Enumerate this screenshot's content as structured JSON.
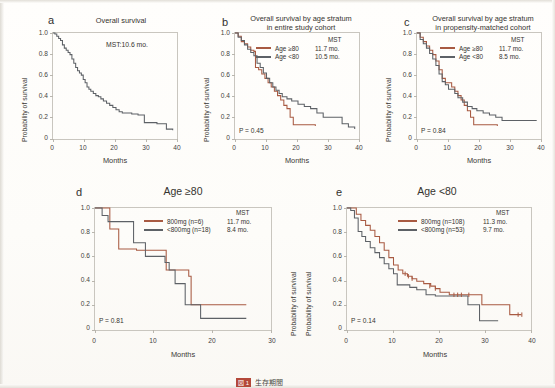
{
  "figure": {
    "caption_tag": "図 1",
    "caption_text": "生存期間",
    "colors": {
      "series_a": "#a85a42",
      "series_b": "#5d6166",
      "axis": "#c9c6bf",
      "text": "#35332f"
    }
  },
  "common": {
    "ylabel": "Probability of survival",
    "xlabel": "Months",
    "yticks": [
      "1.0",
      "0.8",
      "0.6",
      "0.4",
      "0.2",
      "0"
    ],
    "xticks_40": [
      "0",
      "10",
      "20",
      "30",
      "40"
    ],
    "xticks_30": [
      "0",
      "10",
      "20",
      "30"
    ],
    "mst_header": "MST"
  },
  "panels": [
    {
      "id": "a",
      "label": "a",
      "title": "Overall survival",
      "annotation": "MST:10.6 mo.",
      "xticks": [
        "0",
        "10",
        "20",
        "30",
        "40"
      ],
      "xmax": 40
    },
    {
      "id": "b",
      "label": "b",
      "title_line1": "Overall survival by age stratum",
      "title_line2": "in entire study cohort",
      "pvalue": "P = 0.45",
      "xticks": [
        "0",
        "10",
        "20",
        "30",
        "40"
      ],
      "xmax": 40,
      "legend": [
        {
          "name": "Age ≥80",
          "mst": "11.7 mo.",
          "color": "#a85a42"
        },
        {
          "name": "Age <80",
          "mst": "10.5 mo.",
          "color": "#5d6166"
        }
      ]
    },
    {
      "id": "c",
      "label": "c",
      "title_line1": "Overall survival by age stratum",
      "title_line2": "in propensity-matched cohort",
      "pvalue": "P = 0.84",
      "xticks": [
        "0",
        "10",
        "20",
        "30",
        "40"
      ],
      "xmax": 40,
      "legend": [
        {
          "name": "Age ≥80",
          "mst": "11.7 mo.",
          "color": "#a85a42"
        },
        {
          "name": "Age <80",
          "mst": "8.5 mo.",
          "color": "#5d6166"
        }
      ]
    },
    {
      "id": "d",
      "label": "d",
      "title": "Age ≥80",
      "pvalue": "P = 0.81",
      "xticks": [
        "0",
        "10",
        "20",
        "30"
      ],
      "xmax": 30,
      "legend": [
        {
          "name": "800mg (n=6)",
          "mst": "11.7 mo.",
          "color": "#a85a42"
        },
        {
          "name": "<800mg (n=18)",
          "mst": "8.4 mo.",
          "color": "#5d6166"
        }
      ]
    },
    {
      "id": "e",
      "label": "e",
      "title": "Age <80",
      "pvalue": "P = 0.14",
      "xticks": [
        "0",
        "10",
        "20",
        "30",
        "40"
      ],
      "xmax": 40,
      "legend": [
        {
          "name": "800mg (n=108)",
          "mst": "11.3 mo.",
          "color": "#a85a42"
        },
        {
          "name": "<800mg (n=53)",
          "mst": "9.7 mo.",
          "color": "#5d6166"
        }
      ]
    }
  ],
  "chart_data": [
    {
      "type": "line",
      "panel": "a",
      "title": "Overall survival",
      "xlabel": "Months",
      "ylabel": "Probability of survival",
      "xlim": [
        0,
        40
      ],
      "ylim": [
        0,
        1.0
      ],
      "grid": false,
      "legend_position": "none",
      "annotations": [
        "MST:10.6 mo."
      ],
      "series": [
        {
          "name": "Overall",
          "color": "#5d6166",
          "x": [
            0,
            0.6,
            1.2,
            1.8,
            2.4,
            3.0,
            3.6,
            4.2,
            4.8,
            5.4,
            6.0,
            6.6,
            7.2,
            7.8,
            8.4,
            9.0,
            9.6,
            10.2,
            10.8,
            11.4,
            12.0,
            12.8,
            13.6,
            14.4,
            15.2,
            16.0,
            17.0,
            18.0,
            19.0,
            20.0,
            21.0,
            22.0,
            23.0,
            24.0,
            25.0,
            26.0,
            27.0,
            28.0,
            29.0,
            31.0,
            33.0,
            34.5,
            36.0,
            38.0
          ],
          "y": [
            1.0,
            0.99,
            0.97,
            0.95,
            0.93,
            0.89,
            0.86,
            0.84,
            0.82,
            0.8,
            0.76,
            0.72,
            0.68,
            0.65,
            0.63,
            0.61,
            0.57,
            0.54,
            0.5,
            0.48,
            0.46,
            0.44,
            0.42,
            0.41,
            0.39,
            0.37,
            0.35,
            0.33,
            0.31,
            0.29,
            0.27,
            0.26,
            0.26,
            0.26,
            0.25,
            0.25,
            0.24,
            0.24,
            0.17,
            0.17,
            0.16,
            0.16,
            0.11,
            0.1
          ]
        }
      ]
    },
    {
      "type": "line",
      "panel": "b",
      "title": "Overall survival by age stratum in entire study cohort",
      "xlabel": "Months",
      "ylabel": "Probability of survival",
      "xlim": [
        0,
        40
      ],
      "ylim": [
        0,
        1.0
      ],
      "grid": false,
      "legend_position": "top-right",
      "annotations": [
        "P = 0.45"
      ],
      "series": [
        {
          "name": "Age ≥80",
          "mst": 11.7,
          "color": "#a85a42",
          "x": [
            0,
            1.0,
            2.0,
            3.0,
            4.0,
            5.0,
            6.0,
            6.5,
            7.5,
            8.5,
            9.5,
            10.5,
            11.5,
            12.5,
            13.5,
            14.5,
            15.5,
            16.5,
            17.5,
            18.5,
            20.0,
            22.0,
            24.0,
            25.5
          ],
          "y": [
            1.0,
            0.97,
            0.92,
            0.9,
            0.87,
            0.84,
            0.83,
            0.68,
            0.66,
            0.62,
            0.58,
            0.54,
            0.5,
            0.46,
            0.42,
            0.38,
            0.33,
            0.3,
            0.22,
            0.15,
            0.15,
            0.15,
            0.15,
            0.14
          ]
        },
        {
          "name": "Age <80",
          "mst": 10.5,
          "color": "#5d6166",
          "x": [
            0,
            1.0,
            2.0,
            3.0,
            4.0,
            5.0,
            6.0,
            7.0,
            8.0,
            9.0,
            10.0,
            11.0,
            12.0,
            13.0,
            14.0,
            15.0,
            16.5,
            18.0,
            20.0,
            22.0,
            24.0,
            26.0,
            28.0,
            30.0,
            32.0,
            34.0,
            36.0,
            38.0
          ],
          "y": [
            1.0,
            0.96,
            0.93,
            0.89,
            0.85,
            0.82,
            0.79,
            0.72,
            0.68,
            0.63,
            0.58,
            0.54,
            0.5,
            0.47,
            0.44,
            0.41,
            0.39,
            0.37,
            0.34,
            0.32,
            0.3,
            0.26,
            0.22,
            0.22,
            0.22,
            0.16,
            0.13,
            0.11
          ]
        }
      ]
    },
    {
      "type": "line",
      "panel": "c",
      "title": "Overall survival by age stratum in propensity-matched cohort",
      "xlabel": "Months",
      "ylabel": "Probability of survival",
      "xlim": [
        0,
        40
      ],
      "ylim": [
        0,
        1.0
      ],
      "grid": false,
      "legend_position": "top-right",
      "annotations": [
        "P = 0.84"
      ],
      "series": [
        {
          "name": "Age ≥80",
          "mst": 11.7,
          "color": "#a85a42",
          "x": [
            0,
            1.0,
            2.0,
            3.0,
            4.0,
            5.0,
            6.0,
            7.0,
            8.0,
            9.0,
            10.0,
            11.0,
            12.0,
            13.0,
            14.0,
            15.0,
            16.0,
            17.0,
            18.0,
            20.0,
            22.0,
            24.0,
            25.5
          ],
          "y": [
            1.0,
            0.96,
            0.92,
            0.88,
            0.84,
            0.8,
            0.74,
            0.66,
            0.58,
            0.54,
            0.54,
            0.5,
            0.46,
            0.42,
            0.38,
            0.33,
            0.28,
            0.22,
            0.15,
            0.15,
            0.15,
            0.15,
            0.14
          ]
        },
        {
          "name": "Age <80",
          "mst": 8.5,
          "color": "#5d6166",
          "x": [
            0,
            1.0,
            2.0,
            3.0,
            4.0,
            5.0,
            6.0,
            7.0,
            8.0,
            9.0,
            10.0,
            11.0,
            12.0,
            13.0,
            14.5,
            16.0,
            17.5,
            19.0,
            21.0,
            23.0,
            25.0,
            27.0,
            30.0,
            33.0,
            36.0,
            38.0
          ],
          "y": [
            1.0,
            0.94,
            0.9,
            0.86,
            0.81,
            0.76,
            0.7,
            0.62,
            0.55,
            0.52,
            0.48,
            0.48,
            0.44,
            0.4,
            0.36,
            0.32,
            0.3,
            0.28,
            0.26,
            0.24,
            0.22,
            0.19,
            0.19,
            0.19,
            0.19,
            0.19
          ]
        }
      ]
    },
    {
      "type": "line",
      "panel": "d",
      "title": "Age ≥80",
      "xlabel": "Months",
      "ylabel": "Probability of survival",
      "xlim": [
        0,
        30
      ],
      "ylim": [
        0,
        1.0
      ],
      "grid": false,
      "legend_position": "top-right",
      "annotations": [
        "P = 0.81"
      ],
      "series": [
        {
          "name": "800mg (n=6)",
          "mst": 11.7,
          "color": "#a85a42",
          "x": [
            0,
            1.5,
            2.5,
            4.0,
            6.5,
            7.0,
            12.0,
            15.8,
            16.2,
            25.5
          ],
          "y": [
            1.0,
            1.0,
            0.83,
            0.67,
            0.67,
            0.66,
            0.5,
            0.45,
            0.22,
            0.22
          ]
        },
        {
          "name": "<800mg (n=18)",
          "mst": 8.4,
          "color": "#5d6166",
          "x": [
            0,
            1.2,
            2.2,
            3.0,
            5.5,
            6.5,
            7.2,
            8.5,
            11.8,
            12.5,
            13.5,
            14.2,
            15.2,
            17.8,
            25.5
          ],
          "y": [
            1.0,
            0.94,
            0.89,
            0.89,
            0.89,
            0.72,
            0.72,
            0.61,
            0.56,
            0.5,
            0.39,
            0.39,
            0.22,
            0.11,
            0.11
          ]
        }
      ]
    },
    {
      "type": "line",
      "panel": "e",
      "title": "Age <80",
      "xlabel": "Months",
      "ylabel": "Probability of survival",
      "xlim": [
        0,
        40
      ],
      "ylim": [
        0,
        1.0
      ],
      "grid": false,
      "legend_position": "top-right",
      "annotations": [
        "P = 0.14"
      ],
      "series": [
        {
          "name": "800mg (n=108)",
          "mst": 11.3,
          "color": "#a85a42",
          "x": [
            0,
            1.0,
            2.0,
            3.0,
            4.0,
            5.0,
            6.0,
            7.0,
            8.0,
            9.0,
            10.0,
            11.0,
            12.0,
            13.0,
            14.0,
            15.0,
            16.5,
            18.0,
            19.0,
            20.0,
            22.0,
            24.0,
            26.0,
            28.0,
            29.0,
            31.0,
            33.5,
            35.0,
            37.5
          ],
          "y": [
            1.0,
            1.0,
            0.95,
            0.9,
            0.86,
            0.82,
            0.77,
            0.72,
            0.66,
            0.6,
            0.54,
            0.5,
            0.47,
            0.45,
            0.43,
            0.41,
            0.39,
            0.37,
            0.35,
            0.32,
            0.3,
            0.3,
            0.3,
            0.3,
            0.22,
            0.22,
            0.22,
            0.14,
            0.14
          ]
        },
        {
          "name": "<800mg (n=53)",
          "mst": 9.7,
          "color": "#5d6166",
          "x": [
            0,
            0.8,
            1.6,
            2.4,
            3.2,
            4.0,
            5.0,
            6.0,
            7.0,
            8.0,
            9.0,
            10.0,
            10.8,
            12.0,
            13.5,
            15.0,
            17.0,
            19.0,
            20.0,
            22.0,
            24.0,
            26.0,
            27.5,
            28.5,
            30.0,
            32.5
          ],
          "y": [
            1.0,
            0.98,
            0.92,
            0.81,
            0.77,
            0.73,
            0.68,
            0.64,
            0.6,
            0.55,
            0.51,
            0.47,
            0.38,
            0.38,
            0.36,
            0.34,
            0.3,
            0.29,
            0.29,
            0.29,
            0.29,
            0.22,
            0.22,
            0.09,
            0.09,
            0.09
          ]
        }
      ]
    }
  ]
}
